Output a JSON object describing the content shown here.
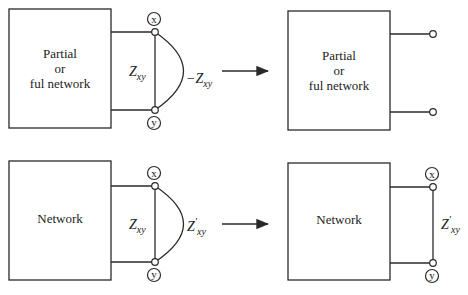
{
  "diagrams": {
    "top_left": {
      "box_lines": [
        "Partial",
        "or",
        "ful network"
      ],
      "terminal_top": "x",
      "terminal_bottom": "y",
      "impedance_label": "Z",
      "impedance_sub": "xy",
      "arc_label_prefix": "−Z",
      "arc_label_sub": "xy"
    },
    "top_right": {
      "box_lines": [
        "Partial",
        "or",
        "ful network"
      ]
    },
    "bottom_left": {
      "box_lines": [
        "Network"
      ],
      "terminal_top": "x",
      "terminal_bottom": "y",
      "impedance_label": "Z",
      "impedance_sub": "xy",
      "arc_label_prefix": "Z",
      "arc_label_prime": "'",
      "arc_label_sub": "xy"
    },
    "bottom_right": {
      "box_lines": [
        "Network"
      ],
      "terminal_top": "x",
      "terminal_bottom": "y",
      "impedance_label": "Z",
      "impedance_prime": "'",
      "impedance_sub": "xy"
    }
  },
  "colors": {
    "line": "#2a2a2a",
    "background": "#ffffff"
  }
}
